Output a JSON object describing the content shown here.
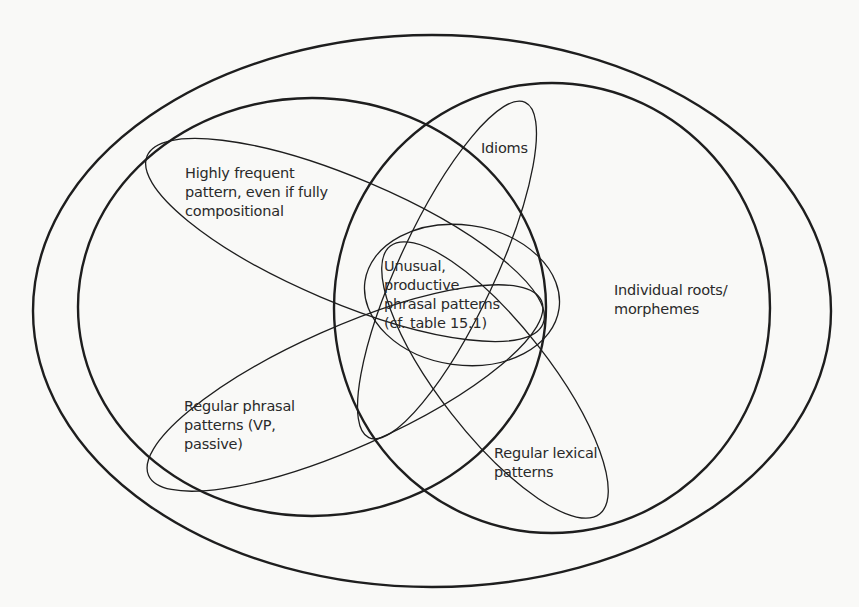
{
  "diagram": {
    "type": "euler-venn",
    "background_color": "#f9f9f7",
    "stroke_color": "#1e1e1e",
    "regions": [
      {
        "id": "outer",
        "label": ""
      },
      {
        "id": "left-circle",
        "label": ""
      },
      {
        "id": "right-circle",
        "label": "Individual roots/\nmorphemes"
      },
      {
        "id": "highly-frequent",
        "label": "Highly frequent\npattern, even if fully\ncompositional"
      },
      {
        "id": "idioms",
        "label": "Idioms"
      },
      {
        "id": "unusual",
        "label": "Unusual,\nproductive\nphrasal patterns\n(cf. table 15.1)"
      },
      {
        "id": "regular-phrasal",
        "label": "Regular phrasal\npatterns (VP,\npassive)"
      },
      {
        "id": "regular-lexical",
        "label": "Regular lexical\npatterns"
      }
    ]
  },
  "labels": {
    "highly_frequent": "Highly frequent\npattern, even if fully\ncompositional",
    "idioms": "Idioms",
    "unusual": "Unusual,\nproductive\nphrasal patterns\n(cf. table 15.1)",
    "individual_roots": "Individual roots/\nmorphemes",
    "regular_phrasal": "Regular phrasal\npatterns (VP,\npassive)",
    "regular_lexical": "Regular lexical\npatterns"
  }
}
